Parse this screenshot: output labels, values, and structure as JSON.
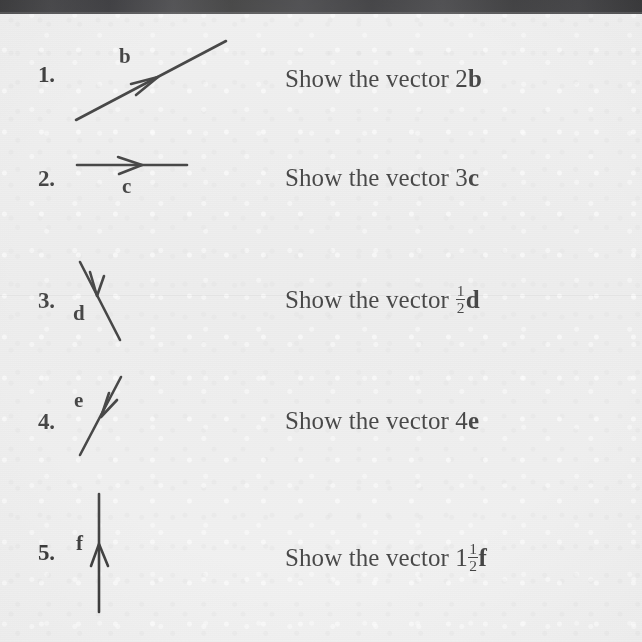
{
  "page": {
    "background_color": "#eaeaea",
    "ink_color": "#151515",
    "topbar_color": "#1b1b1d"
  },
  "exercises": [
    {
      "number": "1.",
      "vector_label": "b",
      "prompt_prefix": "Show the vector ",
      "coefficient": "2",
      "fraction": null,
      "vector_bold": "b",
      "diagram": {
        "type": "arrow-line",
        "direction": "up-right",
        "arrow_position": "mid",
        "description": "slanted line rising to the right with mid-line arrowhead pointing up-right"
      }
    },
    {
      "number": "2.",
      "vector_label": "c",
      "prompt_prefix": "Show the vector ",
      "coefficient": "3",
      "fraction": null,
      "vector_bold": "c",
      "diagram": {
        "type": "arrow-line",
        "direction": "right",
        "arrow_position": "mid",
        "description": "horizontal line with mid-line arrowhead pointing right"
      }
    },
    {
      "number": "3.",
      "vector_label": "d",
      "prompt_prefix": "Show the vector ",
      "coefficient": "",
      "fraction": {
        "numerator": "1",
        "denominator": "2"
      },
      "vector_bold": "d",
      "diagram": {
        "type": "arrow-line",
        "direction": "down-right",
        "arrow_position": "upper",
        "description": "steep line descending to the right with arrowhead pointing down"
      }
    },
    {
      "number": "4.",
      "vector_label": "e",
      "prompt_prefix": "Show the vector ",
      "coefficient": "4",
      "fraction": null,
      "vector_bold": "e",
      "diagram": {
        "type": "arrow-line",
        "direction": "down-left",
        "arrow_position": "upper",
        "description": "steep line rising to the right with arrowhead pointing down-left"
      }
    },
    {
      "number": "5.",
      "vector_label": "f",
      "prompt_prefix": "Show the vector ",
      "coefficient": "1",
      "fraction": {
        "numerator": "1",
        "denominator": "2"
      },
      "vector_bold": "f",
      "diagram": {
        "type": "arrow-line",
        "direction": "up",
        "arrow_position": "mid",
        "description": "vertical line with mid-line arrowhead pointing up"
      }
    }
  ]
}
